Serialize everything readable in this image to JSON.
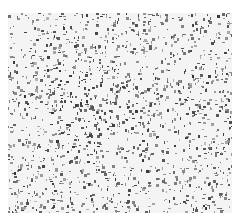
{
  "image": {
    "description": "Grayscale micrograph of densely scattered dark granular particles on a light background",
    "background_color": "#ffffff",
    "field_color": "#f4f4f4",
    "particle_color_dark": "#3a3a3a",
    "particle_color_light": "#9a9a9a",
    "field": {
      "x": 8,
      "y": 13,
      "width": 224,
      "height": 200
    },
    "particles": {
      "count": 2600,
      "seed": 12345,
      "dense_center": {
        "x": 95,
        "y": 105,
        "radius": 45,
        "boost": 1.8
      },
      "sparse_zones": [
        {
          "x": 175,
          "y": 120,
          "radius": 35
        },
        {
          "x": 150,
          "y": 60,
          "radius": 25
        }
      ]
    }
  }
}
